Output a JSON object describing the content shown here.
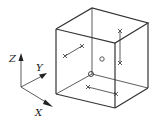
{
  "axes": {
    "x_label": "X",
    "y_label": "Y",
    "z_label": "Z"
  },
  "colors": {
    "stroke": "#333333",
    "background": "#ffffff"
  },
  "cube": {
    "vertices": {
      "front_top_left": [
        56,
        29
      ],
      "back_top_left": [
        92,
        8
      ],
      "back_top_right": [
        148,
        23
      ],
      "front_top_right": [
        115,
        43
      ],
      "front_bottom_left": [
        56,
        94
      ],
      "front_bottom_right": [
        115,
        108
      ],
      "back_bottom_right": [
        148,
        88
      ],
      "back_bottom_left_hidden": [
        92,
        74
      ]
    }
  },
  "markers": [
    {
      "type": "cross-pair",
      "face": "left",
      "points": [
        [
          65,
          56
        ],
        [
          82,
          46
        ]
      ]
    },
    {
      "type": "cross-pair",
      "face": "right",
      "points": [
        [
          120,
          31
        ],
        [
          120,
          63
        ]
      ]
    },
    {
      "type": "cross-pair",
      "face": "bottom",
      "points": [
        [
          88,
          87
        ],
        [
          116,
          94
        ]
      ]
    },
    {
      "type": "circle",
      "face": "right",
      "point": [
        102,
        59
      ]
    },
    {
      "type": "circle",
      "face": "hidden-vertex",
      "point": [
        91,
        74
      ]
    }
  ]
}
